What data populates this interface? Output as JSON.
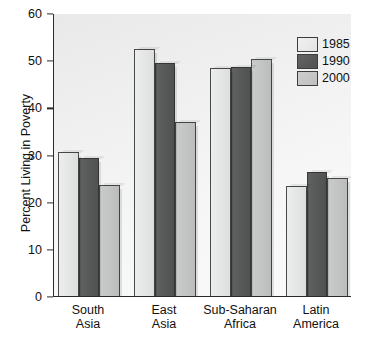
{
  "chart_data": {
    "type": "bar",
    "title": "",
    "xlabel": "",
    "ylabel": "Percent Living in Poverty",
    "ylim": [
      0,
      60
    ],
    "yticks": [
      0,
      10,
      20,
      30,
      40,
      50,
      60
    ],
    "grid": false,
    "legend_position": "top-right",
    "categories": [
      "South Asia",
      "East Asia",
      "Sub-Saharan Africa",
      "Latin America"
    ],
    "category_lines": [
      [
        "South",
        "Asia"
      ],
      [
        "East",
        "Asia"
      ],
      [
        "Sub-Saharan",
        "Africa"
      ],
      [
        "Latin",
        "America"
      ]
    ],
    "series": [
      {
        "name": "1985",
        "color": "#e6e7e7",
        "values": [
          30.5,
          52.3,
          48.3,
          23.3
        ]
      },
      {
        "name": "1990",
        "color": "#585959",
        "values": [
          29.3,
          49.5,
          48.5,
          26.3
        ]
      },
      {
        "name": "2000",
        "color": "#c3c4c4",
        "values": [
          23.5,
          36.8,
          50.3,
          25.0
        ]
      }
    ]
  },
  "legend": {
    "items": [
      {
        "label": "1985",
        "swatch": "s1985"
      },
      {
        "label": "1990",
        "swatch": "s1990"
      },
      {
        "label": "2000",
        "swatch": "s2000"
      }
    ]
  },
  "axis": {
    "y_label": "Percent Living in Poverty",
    "y_tick_labels": [
      "60",
      "50",
      "40",
      "30",
      "20",
      "10",
      "0"
    ]
  }
}
